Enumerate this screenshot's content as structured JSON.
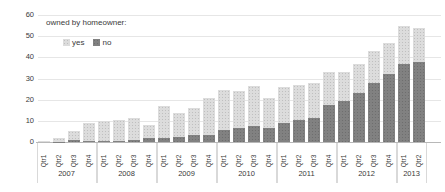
{
  "colors": {
    "background": "#ffffff",
    "gridline": "#e6e6e6",
    "axis_line": "#b8b8b8",
    "text": "#3a3a3a",
    "year_separator": "#d9d9d9",
    "series_yes": "#dcdcdc",
    "series_no": "#818181"
  },
  "chart_data": {
    "type": "bar",
    "stacked": true,
    "title": "",
    "legend": {
      "title": "owned by homeowner:",
      "position": "top-left"
    },
    "grid": true,
    "y_axis": {
      "min": 0,
      "max": 60,
      "ticks": [
        0,
        10,
        20,
        30,
        40,
        50,
        60
      ]
    },
    "categories": [
      "Qtr1",
      "Qtr2",
      "Qtr3",
      "Qtr4",
      "Qtr1",
      "Qtr2",
      "Qtr3",
      "Qtr4",
      "Qtr1",
      "Qtr2",
      "Qtr3",
      "Qtr4",
      "Qtr1",
      "Qtr2",
      "Qtr3",
      "Qtr4",
      "Qtr1",
      "Qtr2",
      "Qtr3",
      "Qtr4",
      "Qtr1",
      "Qtr2",
      "Qtr3",
      "Qtr4",
      "Qtr1",
      "Qtr2"
    ],
    "year_groups": [
      {
        "label": "2007",
        "count": 4
      },
      {
        "label": "2008",
        "count": 4
      },
      {
        "label": "2009",
        "count": 4
      },
      {
        "label": "2010",
        "count": 4
      },
      {
        "label": "2011",
        "count": 4
      },
      {
        "label": "2012",
        "count": 4
      },
      {
        "label": "2013",
        "count": 2
      }
    ],
    "series": [
      {
        "name": "yes",
        "color": "#dcdcdc",
        "stack_position": "top",
        "values": [
          0.3,
          1.5,
          4,
          8.5,
          9.5,
          9.8,
          10.5,
          6,
          15,
          11,
          12.5,
          17.5,
          19,
          17.5,
          19,
          14.5,
          17,
          16.5,
          16.5,
          15.5,
          13.5,
          14,
          15,
          15,
          18,
          16
        ]
      },
      {
        "name": "no",
        "color": "#818181",
        "stack_position": "bottom",
        "values": [
          0,
          0.2,
          1,
          0.5,
          0.5,
          0.7,
          1,
          2,
          2,
          2.5,
          3.5,
          3.5,
          5.5,
          6.5,
          7.5,
          6.5,
          9,
          10.5,
          11.5,
          17.5,
          19.5,
          23,
          28,
          32,
          37,
          38
        ]
      }
    ],
    "totals": [
      0.3,
      1.7,
      5,
      9,
      10,
      10.5,
      11.5,
      8,
      17,
      13.5,
      16,
      21,
      24.5,
      24,
      26.5,
      21,
      26,
      27,
      28,
      33,
      33,
      37,
      43,
      47,
      55,
      54
    ]
  }
}
